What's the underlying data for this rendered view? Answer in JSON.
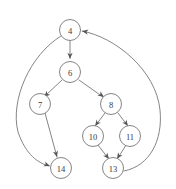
{
  "figure": {
    "type": "directed-graph",
    "background_color": "#ffffff",
    "stroke_color": "#6f6f6f",
    "label_color": "#3b3b3b",
    "node_radius": 10.5
  },
  "nodes": [
    {
      "id": "4",
      "label": "4",
      "x": 70,
      "y": 30
    },
    {
      "id": "6",
      "label": "6",
      "x": 70,
      "y": 72
    },
    {
      "id": "7",
      "label": "7",
      "x": 40,
      "y": 104
    },
    {
      "id": "8",
      "label": "8",
      "x": 111,
      "y": 104
    },
    {
      "id": "10",
      "label": "10",
      "x": 93,
      "y": 136
    },
    {
      "id": "11",
      "label": "11",
      "x": 130,
      "y": 136
    },
    {
      "id": "13",
      "label": "13",
      "x": 113,
      "y": 168
    },
    {
      "id": "14",
      "label": "14",
      "x": 61,
      "y": 168
    }
  ],
  "edges": [
    {
      "from": "4",
      "to": "6",
      "shape": "straight"
    },
    {
      "from": "4",
      "to": "14",
      "shape": "curve-left"
    },
    {
      "from": "6",
      "to": "7",
      "shape": "straight"
    },
    {
      "from": "6",
      "to": "8",
      "shape": "straight"
    },
    {
      "from": "7",
      "to": "14",
      "shape": "straight"
    },
    {
      "from": "8",
      "to": "10",
      "shape": "straight"
    },
    {
      "from": "8",
      "to": "11",
      "shape": "straight"
    },
    {
      "from": "10",
      "to": "13",
      "shape": "straight"
    },
    {
      "from": "11",
      "to": "13",
      "shape": "straight"
    },
    {
      "from": "13",
      "to": "4",
      "shape": "curve-right"
    }
  ],
  "paths": {
    "edge_4_6": "M 70,41 L 70,58",
    "edge_4_14": "M 61,36 C 30,55 10,100 18,132 C 26,155 38,163 49,166",
    "edge_6_7": "M 62,80 L 45,96",
    "edge_6_8": "M 79,80 L 103,97",
    "edge_7_14": "M 45,113 L 57,157",
    "edge_8_10": "M 105,113 L 96,125",
    "edge_8_11": "M 118,113 L 127,125",
    "edge_10_13": "M 98,145 L 108,158",
    "edge_11_13": "M 126,145 L 118,158",
    "edge_13_4": "M 124,171 C 150,166 163,140 160,110 C 156,70 115,37 82,31"
  },
  "arrows": [
    {
      "edge": "4-6",
      "x": 70,
      "y": 59,
      "angle": 90
    },
    {
      "edge": "4-14",
      "x": 50,
      "y": 166,
      "angle": 20
    },
    {
      "edge": "6-7",
      "x": 44,
      "y": 97,
      "angle": 137
    },
    {
      "edge": "6-8",
      "x": 104,
      "y": 97,
      "angle": 35
    },
    {
      "edge": "7-14",
      "x": 57,
      "y": 157,
      "angle": 75
    },
    {
      "edge": "8-10",
      "x": 95,
      "y": 126,
      "angle": 127
    },
    {
      "edge": "8-11",
      "x": 128,
      "y": 126,
      "angle": 53
    },
    {
      "edge": "10-13",
      "x": 109,
      "y": 159,
      "angle": 52
    },
    {
      "edge": "11-13",
      "x": 117,
      "y": 159,
      "angle": 122
    },
    {
      "edge": "13-4",
      "x": 82,
      "y": 31,
      "angle": 190
    }
  ]
}
